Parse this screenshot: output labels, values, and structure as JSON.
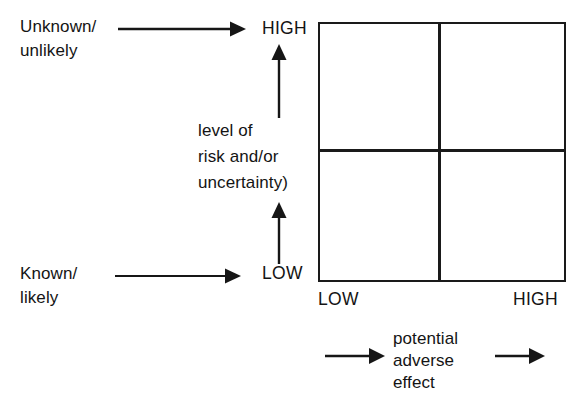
{
  "figure": {
    "type": "2x2-risk-matrix-diagram",
    "title": "",
    "vertical_axis": {
      "label_lines": [
        "level of",
        "risk and/or",
        "uncertainty)"
      ],
      "low_end_label": "LOW",
      "high_end_label": "HIGH",
      "low_descriptor_lines": [
        "Known/",
        "likely"
      ],
      "high_descriptor_lines": [
        "Unknown/",
        "unlikely"
      ]
    },
    "horizontal_axis": {
      "label_lines": [
        "potential",
        "adverse",
        "effect"
      ],
      "low_end_label": "LOW",
      "high_end_label": "HIGH"
    },
    "matrix": {
      "rows": 2,
      "columns": 2,
      "cells": [
        "",
        "",
        "",
        ""
      ]
    },
    "colors": {
      "ink": "#161616",
      "background": "#ffffff"
    }
  }
}
